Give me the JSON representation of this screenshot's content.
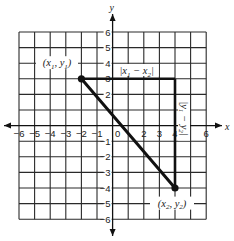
{
  "figure": {
    "axes": {
      "x_label": "x",
      "y_label": "y",
      "x_range": [
        -6,
        6
      ],
      "y_range": [
        -6,
        6
      ],
      "x_ticks": [
        -6,
        -5,
        -4,
        -3,
        -2,
        -1,
        0,
        2,
        3,
        4,
        6
      ],
      "y_ticks": [
        6,
        5,
        4,
        3,
        2,
        -1,
        -2,
        -3,
        -4,
        -5,
        -6
      ],
      "origin_label": "0"
    },
    "points": [
      {
        "id": "p1",
        "x": -2,
        "y": 3,
        "label_main": "(x",
        "sub1": "1",
        "mid": ", y",
        "sub2": "1",
        "end": ")"
      },
      {
        "id": "p2",
        "x": 4,
        "y": -4,
        "label_main": "(x",
        "sub1": "2",
        "mid": ", y",
        "sub2": "2",
        "end": ")"
      }
    ],
    "horizontal_leg_label": {
      "pre": "|x",
      "sub1": "1",
      "mid": " − x",
      "sub2": "2",
      "end": "|"
    },
    "vertical_leg_label": {
      "pre": "|y",
      "sub1": "1",
      "mid": " − y",
      "sub2": "2",
      "end": "|"
    },
    "colors": {
      "ink": "#111111",
      "grid": "#2a2a2a",
      "background": "#ffffff"
    }
  }
}
